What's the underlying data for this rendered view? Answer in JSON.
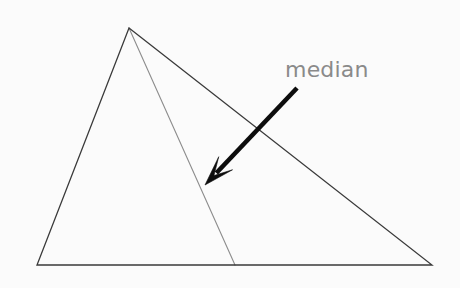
{
  "figure": {
    "kind": "geometry-diagram",
    "background_color": "#fbfbfb",
    "width": 460,
    "height": 288
  },
  "annotation": {
    "label": "median",
    "label_color": "#8a8a8a",
    "label_x": 285,
    "label_y": 77,
    "font_size": 22
  },
  "arrow": {
    "name": "pointer-arrow",
    "color": "#0d0d0d",
    "tail_x": 297,
    "tail_y": 88,
    "tip_x": 205,
    "tip_y": 185,
    "shaft_width": 4.6
  },
  "triangle": {
    "name": "main-triangle",
    "stroke_color": "#3a3a3a",
    "stroke_width": 1.3,
    "fill": "none",
    "vertices": [
      {
        "name": "apex",
        "x": 129,
        "y": 28
      },
      {
        "name": "bottom-right",
        "x": 432,
        "y": 265
      },
      {
        "name": "bottom-left",
        "x": 37,
        "y": 265
      }
    ],
    "points_path": "129,28 432,265 37,265"
  },
  "median_segment": {
    "name": "median-line",
    "stroke_color": "#8d8d8d",
    "stroke_width": 1.1,
    "from_x": 129,
    "from_y": 28,
    "to_x": 235,
    "to_y": 265,
    "base_midpoint_label": "midpoint of base"
  }
}
